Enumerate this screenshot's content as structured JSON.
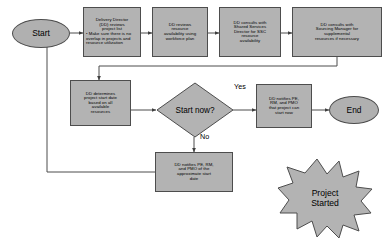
{
  "diagram": {
    "colors": {
      "node_fill": "#b3b3b3",
      "node_stroke": "#4d4d4d",
      "edge": "#4d4d4d",
      "background": "#ffffff",
      "text": "#000000"
    },
    "nodes": {
      "start": {
        "label": "Start",
        "shape": "ellipse"
      },
      "dd_reviews_project_list": {
        "line1": "Delivery Director",
        "line2": "(DD) reviews",
        "line3": "project list",
        "bullet1": "• Make sure there is no",
        "bullet2": "overlap in projects and",
        "bullet3": "resource utilization",
        "shape": "process"
      },
      "dd_reviews_resource_availability": {
        "line1": "DD reviews",
        "line2": "resource",
        "line3": "availability using",
        "line4": "workforce plan",
        "shape": "process"
      },
      "dd_consults_ssc": {
        "line1": "DD consults with",
        "line2": "Shared Services",
        "line3": "Director for SSC",
        "line4": "resource",
        "line5": "availability",
        "shape": "process"
      },
      "dd_consults_sourcing": {
        "line1": "DD consults with",
        "line2": "Sourcing Manager for",
        "line3": "supplemental",
        "line4": "resources if necessary",
        "shape": "process"
      },
      "dd_determines_start_date": {
        "line1": "DD determines",
        "line2": "project start date",
        "line3": "based on all",
        "line4": "available",
        "line5": "resources",
        "shape": "process"
      },
      "start_now_decision": {
        "label": "Start now?",
        "shape": "diamond"
      },
      "dd_notifies_can_start": {
        "line1": "DD notifies PE,",
        "line2": "RM, and PMO",
        "line3": "that project can",
        "line4": "start now",
        "shape": "process"
      },
      "dd_notifies_approximate": {
        "line1": "DD notifies PE, RM,",
        "line2": "and PMO of the",
        "line3": "approximate start",
        "line4": "date",
        "shape": "process"
      },
      "end": {
        "label": "End",
        "shape": "ellipse"
      },
      "project_started": {
        "line1": "Project",
        "line2": "Started",
        "shape": "starburst"
      }
    },
    "edge_labels": {
      "yes": "Yes",
      "no": "No"
    }
  }
}
